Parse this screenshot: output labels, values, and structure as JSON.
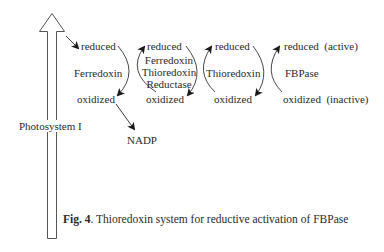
{
  "figure": {
    "caption_prefix": "Fig. 4",
    "caption_text": ". Thioredoxin system for reductive activation of FBPase"
  },
  "photosystem": {
    "label": "Photosystem I"
  },
  "columns": [
    {
      "reduced": "reduced",
      "name": "Ferredoxin",
      "oxidized": "oxidized"
    },
    {
      "reduced": "reduced",
      "name_lines": [
        "Ferredoxin",
        "Thioredoxin",
        "Reductase"
      ],
      "oxidized": "oxidized"
    },
    {
      "reduced": "reduced",
      "name": "Thioredoxin",
      "oxidized": "oxidized"
    },
    {
      "reduced": "reduced  (active)",
      "name": "FBPase",
      "oxidized": "oxidized  (inactive)"
    }
  ],
  "nadp": {
    "label": "NADP"
  }
}
